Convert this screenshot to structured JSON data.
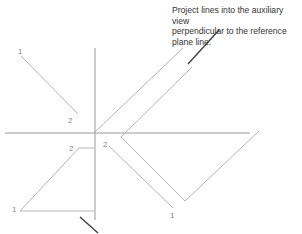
{
  "annotation": {
    "text": "Project lines into the auxiliary view\nperpendicular to the reference\nplane line."
  },
  "labels": {
    "top_view_p1": "1",
    "top_view_p2": "2",
    "front_view_p1": "1",
    "front_view_p2": "2",
    "aux_view_p2": "2",
    "aux_view_p1": "1"
  },
  "colors": {
    "construction_line": "#b5b5b5",
    "reference_line": "#9a9a9a",
    "leader_line": "#3a3a3a",
    "text": "#333333"
  }
}
